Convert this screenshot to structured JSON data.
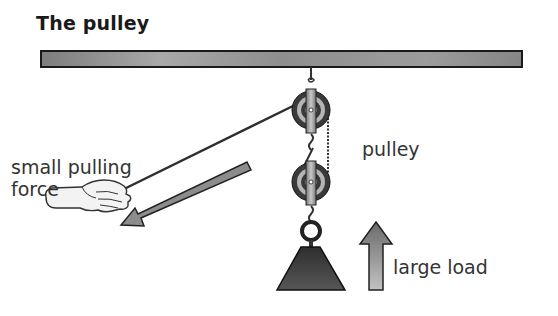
{
  "title": "The pulley",
  "labels": {
    "small_pulling_force_line1": "small pulling",
    "small_pulling_force_line2": "force",
    "pulley": "pulley",
    "large_load": "large load"
  },
  "colors": {
    "beam_fill": "#8a8a8a",
    "beam_stroke": "#1a1a1a",
    "pulley_dark": "#3a3a3a",
    "pulley_light": "#b5b5b5",
    "rope": "#333333",
    "arrow_fill": "#8c8c8c",
    "load_fill": "#3c3c3c",
    "hand_fill": "#f3f3f3"
  },
  "elements": [
    {
      "name": "ceiling-beam"
    },
    {
      "name": "upper-pulley"
    },
    {
      "name": "lower-pulley"
    },
    {
      "name": "rope"
    },
    {
      "name": "hand"
    },
    {
      "name": "pull-direction-arrow"
    },
    {
      "name": "load-weight"
    },
    {
      "name": "load-lift-arrow"
    }
  ]
}
